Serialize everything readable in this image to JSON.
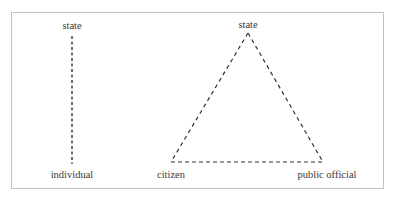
{
  "diagrams": {
    "dyad": {
      "top_label": "state",
      "bottom_label": "individual"
    },
    "triad": {
      "top_label": "state",
      "bottom_left_label": "citizen",
      "bottom_right_label": "public official"
    }
  },
  "style": {
    "line_color": "#333333",
    "border_color": "#c2c2c2",
    "text_color": "#3a3a3a"
  }
}
